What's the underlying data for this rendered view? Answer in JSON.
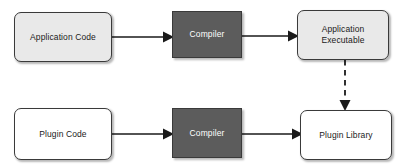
{
  "diagram": {
    "background_color": "#ffffff",
    "colors": {
      "node_light": "#e9e9e9",
      "node_white": "#ffffff",
      "node_dark": "#5c5c5c",
      "border": "#3a3a3a",
      "text_dark": "#1a1a1a",
      "text_light": "#ffffff",
      "edge": "#1a1a1a"
    },
    "nodes": [
      {
        "id": "application-code",
        "label": "Application Code",
        "shape": "rounded-rectangle",
        "fill": "#e9e9e9",
        "text_color": "#1a1a1a",
        "x": 14,
        "y": 12,
        "w": 98,
        "h": 50
      },
      {
        "id": "compiler-top",
        "label": "Compiler",
        "shape": "rectangle",
        "fill": "#5c5c5c",
        "text_color": "#ffffff",
        "x": 172,
        "y": 11,
        "w": 70,
        "h": 47
      },
      {
        "id": "application-executable",
        "label": "Application\nExecutable",
        "shape": "rounded-rectangle",
        "fill": "#e9e9e9",
        "text_color": "#1a1a1a",
        "x": 297,
        "y": 10,
        "w": 92,
        "h": 50
      },
      {
        "id": "plugin-code",
        "label": "Plugin Code",
        "shape": "rounded-rectangle",
        "fill": "#ffffff",
        "text_color": "#1a1a1a",
        "x": 14,
        "y": 108,
        "w": 98,
        "h": 52
      },
      {
        "id": "compiler-bottom",
        "label": "Compiler",
        "shape": "rectangle",
        "fill": "#5c5c5c",
        "text_color": "#ffffff",
        "x": 172,
        "y": 108,
        "w": 70,
        "h": 50
      },
      {
        "id": "plugin-library",
        "label": "Plugin Library",
        "shape": "rounded-rectangle",
        "fill": "#ffffff",
        "text_color": "#1a1a1a",
        "x": 300,
        "y": 110,
        "w": 92,
        "h": 50
      }
    ],
    "edges": [
      {
        "id": "application-code-to-compiler-top",
        "from": "application-code",
        "to": "compiler-top",
        "style": "solid",
        "arrowhead": "filled-triangle",
        "orientation": "horizontal"
      },
      {
        "id": "compiler-top-to-application-executable",
        "from": "compiler-top",
        "to": "application-executable",
        "style": "solid",
        "arrowhead": "filled-triangle",
        "orientation": "horizontal"
      },
      {
        "id": "plugin-code-to-compiler-bottom",
        "from": "plugin-code",
        "to": "compiler-bottom",
        "style": "solid",
        "arrowhead": "filled-triangle",
        "orientation": "horizontal"
      },
      {
        "id": "compiler-bottom-to-plugin-library",
        "from": "compiler-bottom",
        "to": "plugin-library",
        "style": "solid",
        "arrowhead": "filled-triangle",
        "orientation": "horizontal"
      },
      {
        "id": "application-executable-to-plugin-library",
        "from": "application-executable",
        "to": "plugin-library",
        "style": "dashed",
        "arrowhead": "filled-triangle",
        "orientation": "vertical"
      }
    ]
  }
}
